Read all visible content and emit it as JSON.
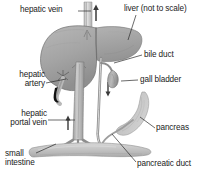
{
  "figure": {
    "background_color": "#ffffff",
    "width": 203,
    "height": 182
  },
  "labels": [
    {
      "id": "hepatic-vein",
      "text": "hepatic vein",
      "x": 20,
      "y": 9,
      "align": "left"
    },
    {
      "id": "liver",
      "text": "liver (not to scale)",
      "x": 126,
      "y": 8,
      "align": "left"
    },
    {
      "id": "bile-duct",
      "text": "bile duct",
      "x": 143,
      "y": 54,
      "align": "left"
    },
    {
      "id": "gall-bladder",
      "text": "gall bladder",
      "x": 140,
      "y": 77,
      "align": "left"
    },
    {
      "id": "hepatic-artery",
      "text": "hepatic\nartery",
      "x": 8,
      "y": 74,
      "align": "right"
    },
    {
      "id": "hepatic-portal-vein",
      "text": "hepatic\nportal vein",
      "x": 4,
      "y": 113,
      "align": "right"
    },
    {
      "id": "pancreas",
      "text": "pancreas",
      "x": 156,
      "y": 126,
      "align": "left"
    },
    {
      "id": "small-intestine",
      "text": "small\nintestine",
      "x": 6,
      "y": 152,
      "align": "left"
    },
    {
      "id": "pancreatic-duct",
      "text": "pancreatic duct",
      "x": 138,
      "y": 163,
      "align": "left"
    }
  ],
  "label_text": {
    "hepatic_vein": "hepatic vein",
    "liver": "liver (not to scale)",
    "bile_duct": "bile duct",
    "gall_bladder": "gall bladder",
    "hepatic_artery_line1": "hepatic",
    "hepatic_artery_line2": "artery",
    "hepatic_portal_vein_line1": "hepatic",
    "hepatic_portal_vein_line2": "portal vein",
    "pancreas": "pancreas",
    "small_intestine_line1": "small",
    "small_intestine_line2": "intestine",
    "pancreatic_duct": "pancreatic duct"
  },
  "structures": [
    {
      "id": "liver",
      "name": "liver",
      "fill": "#a9a9a9",
      "stroke": "#6e6e6e"
    },
    {
      "id": "vena-cava",
      "name": "inferior-vena-cava",
      "fill": "#d8d8d8",
      "stroke": "#8a8a8a"
    },
    {
      "id": "hepatic-portal-vein",
      "name": "hepatic-portal-vein",
      "fill": "#b5b5b5",
      "stroke": "#7d7d7d"
    },
    {
      "id": "bile-duct",
      "name": "bile-duct",
      "fill": "#c6c6c6",
      "stroke": "#7a7a7a"
    },
    {
      "id": "gall-bladder",
      "name": "gall-bladder",
      "fill": "#b0b0b0",
      "stroke": "#6f6f6f"
    },
    {
      "id": "hepatic-artery",
      "name": "hepatic-artery",
      "fill": "#bdbdbd",
      "stroke": "#111111"
    },
    {
      "id": "pancreas",
      "name": "pancreas",
      "fill": "#cfcfcf",
      "stroke": "#8e8e8e"
    },
    {
      "id": "small-intestine",
      "name": "small-intestine",
      "fill": "#c9c9c9",
      "stroke": "#8a8a8a"
    },
    {
      "id": "pancreatic-duct",
      "name": "pancreatic-duct",
      "fill": "#bdbdbd",
      "stroke": "#7d7d7d"
    }
  ],
  "flow_arrows": [
    {
      "id": "vena-cava-arrow",
      "direction": "up",
      "x": 96,
      "y": 8
    },
    {
      "id": "portal-vein-arrow",
      "direction": "up",
      "x": 79,
      "y": 118
    },
    {
      "id": "bile-duct-arrow",
      "direction": "down",
      "x": 108,
      "y": 90
    }
  ],
  "colors": {
    "ink": "#1a1a1a",
    "leader": "#2b2b2b",
    "tissue_mid": "#a9a9a9",
    "tissue_light": "#cfcfcf",
    "tissue_dark": "#7f7f7f",
    "artery_dark": "#111111"
  }
}
